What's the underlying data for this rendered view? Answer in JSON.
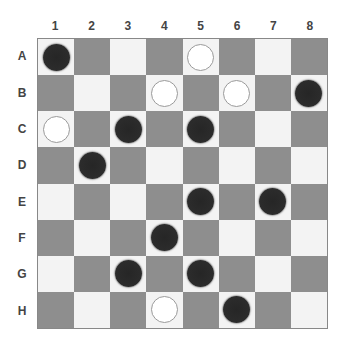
{
  "board": {
    "columns": [
      "1",
      "2",
      "3",
      "4",
      "5",
      "6",
      "7",
      "8"
    ],
    "rows": [
      "A",
      "B",
      "C",
      "D",
      "E",
      "F",
      "G",
      "H"
    ],
    "colors": {
      "light_square": "#f3f3f3",
      "dark_square": "#8e8e8e",
      "black_piece": "#2a2a2a",
      "white_piece_outline": "#9a9a9a",
      "label": "#444444"
    },
    "pieces": [
      {
        "row": "A",
        "col": "1",
        "color": "black"
      },
      {
        "row": "A",
        "col": "5",
        "color": "white"
      },
      {
        "row": "B",
        "col": "4",
        "color": "white"
      },
      {
        "row": "B",
        "col": "6",
        "color": "white"
      },
      {
        "row": "B",
        "col": "8",
        "color": "black"
      },
      {
        "row": "C",
        "col": "1",
        "color": "white"
      },
      {
        "row": "C",
        "col": "3",
        "color": "black"
      },
      {
        "row": "C",
        "col": "5",
        "color": "black"
      },
      {
        "row": "D",
        "col": "2",
        "color": "black"
      },
      {
        "row": "E",
        "col": "5",
        "color": "black"
      },
      {
        "row": "E",
        "col": "7",
        "color": "black"
      },
      {
        "row": "F",
        "col": "4",
        "color": "black"
      },
      {
        "row": "G",
        "col": "3",
        "color": "black"
      },
      {
        "row": "G",
        "col": "5",
        "color": "black"
      },
      {
        "row": "H",
        "col": "4",
        "color": "white"
      },
      {
        "row": "H",
        "col": "6",
        "color": "black"
      }
    ]
  }
}
